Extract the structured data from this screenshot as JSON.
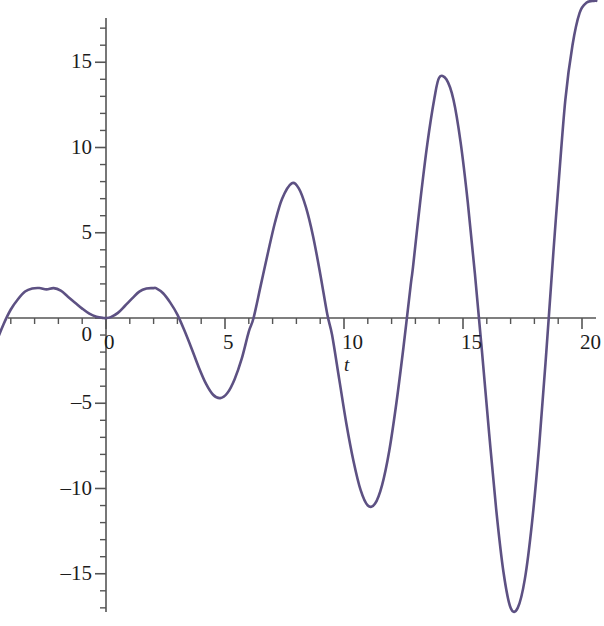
{
  "chart_data": {
    "type": "line",
    "title": "",
    "subtitle": "",
    "xlabel": "t",
    "ylabel": "",
    "xlim": [
      -4.9,
      20.6
    ],
    "ylim": [
      -18.6,
      18.6
    ],
    "grid": false,
    "legend": null,
    "line_color": "#5d5183",
    "axis_color": "#555555",
    "x_ticks_major": [
      0,
      5,
      10,
      15,
      20
    ],
    "x_tick_labels": [
      "0",
      "5",
      "10",
      "15",
      "20"
    ],
    "x_tick_minor_step": 1,
    "y_ticks_major": [
      -15,
      -10,
      -5,
      0,
      5,
      10,
      15
    ],
    "y_tick_labels": [
      "–15",
      "–10",
      "–5",
      "0",
      "5",
      "10",
      "15"
    ],
    "y_tick_minor_step": 1,
    "series": [
      {
        "name": "y(t)",
        "description": "growing oscillation, amplitude increases with t",
        "x": [
          -4.9,
          -4.6,
          -4.3,
          -4.0,
          -3.7,
          -3.4,
          -3.1,
          -2.8,
          -2.5,
          -2.2,
          -1.9,
          -1.6,
          -1.3,
          -1.0,
          -0.7,
          -0.4,
          -0.1,
          0.0,
          0.2,
          0.5,
          0.8,
          1.1,
          1.4,
          1.7,
          2.0,
          2.1,
          2.4,
          2.7,
          3.0,
          3.3,
          3.6,
          3.9,
          4.2,
          4.5,
          4.8,
          5.1,
          5.4,
          5.7,
          6.0,
          6.2,
          6.5,
          6.8,
          7.1,
          7.4,
          7.8,
          8.1,
          8.4,
          8.7,
          9.0,
          9.3,
          9.5,
          9.8,
          10.1,
          10.4,
          10.7,
          11.0,
          11.3,
          11.6,
          11.9,
          12.2,
          12.5,
          12.8,
          12.9,
          13.2,
          13.5,
          13.8,
          14.0,
          14.3,
          14.6,
          14.9,
          15.2,
          15.5,
          15.8,
          16.1,
          16.4,
          16.7,
          17.0,
          17.3,
          17.6,
          17.9,
          18.2,
          18.5,
          18.8,
          19.0,
          19.3,
          19.6,
          19.9,
          20.2,
          20.5,
          20.6
        ],
        "y": [
          -2.6,
          -1.4,
          -0.35,
          0.5,
          1.1,
          1.55,
          1.73,
          1.76,
          1.68,
          1.75,
          1.6,
          1.25,
          0.9,
          0.55,
          0.25,
          0.07,
          0.0,
          0.0,
          0.05,
          0.3,
          0.72,
          1.15,
          1.55,
          1.73,
          1.75,
          1.75,
          1.45,
          0.9,
          0.2,
          -0.75,
          -1.8,
          -2.9,
          -3.85,
          -4.5,
          -4.7,
          -4.4,
          -3.6,
          -2.4,
          -0.8,
          0.0,
          1.9,
          3.8,
          5.6,
          7.0,
          7.9,
          7.6,
          6.5,
          4.8,
          2.6,
          0.2,
          -1.0,
          -3.6,
          -6.2,
          -8.4,
          -10.1,
          -11.0,
          -10.9,
          -9.8,
          -7.8,
          -5.0,
          -1.7,
          1.9,
          3.0,
          6.8,
          10.2,
          12.9,
          14.1,
          14.0,
          12.8,
          10.3,
          6.8,
          2.6,
          -2.0,
          -6.8,
          -11.3,
          -14.9,
          -17.0,
          -17.0,
          -15.3,
          -12.0,
          -7.5,
          -2.0,
          3.9,
          7.6,
          12.8,
          16.0,
          17.9,
          18.5,
          18.6,
          18.6
        ]
      }
    ]
  },
  "axis": {
    "x_label": "t"
  }
}
